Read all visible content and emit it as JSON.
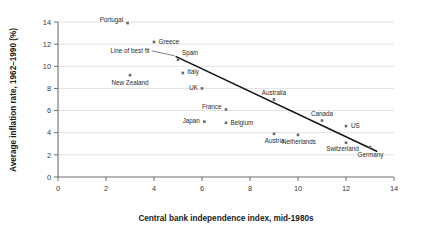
{
  "chart_data": {
    "type": "scatter",
    "title": "",
    "xlabel": "Central bank independence index, mid-1980s",
    "ylabel": "Average inflation rate, 1962–1990 (%)",
    "xlim": [
      0,
      14
    ],
    "ylim": [
      0,
      14
    ],
    "xticks": [
      0,
      2,
      4,
      6,
      8,
      10,
      12,
      14
    ],
    "yticks": [
      0,
      2,
      4,
      6,
      8,
      10,
      12,
      14
    ],
    "grid": "horizontal",
    "legend": "none",
    "points": [
      {
        "label": "Portugal",
        "x": 2.9,
        "y": 13.9
      },
      {
        "label": "Greece",
        "x": 4.0,
        "y": 12.2
      },
      {
        "label": "Spain",
        "x": 5.0,
        "y": 10.6
      },
      {
        "label": "Italy",
        "x": 5.2,
        "y": 9.4
      },
      {
        "label": "New Zealand",
        "x": 3.0,
        "y": 9.2
      },
      {
        "label": "UK",
        "x": 6.0,
        "y": 8.0
      },
      {
        "label": "Australia",
        "x": 9.0,
        "y": 7.0
      },
      {
        "label": "France",
        "x": 7.0,
        "y": 6.1
      },
      {
        "label": "Japan",
        "x": 6.1,
        "y": 5.0
      },
      {
        "label": "Canada",
        "x": 11.0,
        "y": 5.1
      },
      {
        "label": "Belgium",
        "x": 7.0,
        "y": 4.9
      },
      {
        "label": "US",
        "x": 12.0,
        "y": 4.6
      },
      {
        "label": "Austria",
        "x": 9.0,
        "y": 3.9
      },
      {
        "label": "Netherlands",
        "x": 10.0,
        "y": 3.8
      },
      {
        "label": "Switzerland",
        "x": 12.0,
        "y": 3.1
      },
      {
        "label": "Germany",
        "x": 13.0,
        "y": 2.7
      }
    ],
    "fit_line": {
      "label": "Line of best fit",
      "x1": 4.9,
      "y1": 10.9,
      "x2": 13.3,
      "y2": 2.3
    },
    "annotations": [
      {
        "name": "line-of-best-fit-label",
        "text": "Line of best fit"
      }
    ]
  }
}
